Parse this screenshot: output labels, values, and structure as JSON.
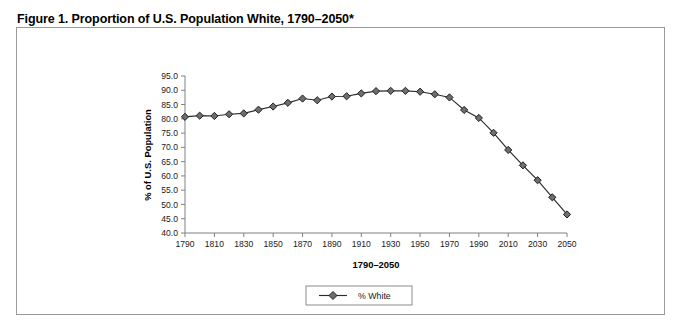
{
  "figure": {
    "title": "Figure 1. Proportion of U.S. Population White, 1790–2050*",
    "border_color": "#9a9a9a",
    "background": "#ffffff"
  },
  "chart_data": {
    "type": "line",
    "title": "",
    "xlabel": "1790–2050",
    "ylabel": "% of U.S. Population",
    "x": [
      1790,
      1800,
      1810,
      1820,
      1830,
      1840,
      1850,
      1860,
      1870,
      1880,
      1890,
      1900,
      1910,
      1920,
      1930,
      1940,
      1950,
      1960,
      1970,
      1980,
      1990,
      2000,
      2010,
      2020,
      2030,
      2040,
      2050
    ],
    "series": [
      {
        "name": "% White",
        "values": [
          80.7,
          81.1,
          81.0,
          81.6,
          81.9,
          83.2,
          84.3,
          85.6,
          87.1,
          86.5,
          87.8,
          87.9,
          88.9,
          89.7,
          89.8,
          89.8,
          89.5,
          88.6,
          87.5,
          83.1,
          80.3,
          75.1,
          69.1,
          63.7,
          58.5,
          52.5,
          46.5
        ]
      }
    ],
    "ylim": [
      40.0,
      95.0
    ],
    "yticks": [
      "40.0",
      "45.0",
      "50.0",
      "55.0",
      "60.0",
      "65.0",
      "70.0",
      "75.0",
      "80.0",
      "85.0",
      "90.0",
      "95.0"
    ],
    "xticks": [
      "1790",
      "1810",
      "1830",
      "1850",
      "1870",
      "1890",
      "1910",
      "1930",
      "1950",
      "1970",
      "1990",
      "2010",
      "2030",
      "2050"
    ],
    "grid": false,
    "legend_position": "bottom-center",
    "marker": "diamond",
    "line_color": "#2b2b2b",
    "marker_fill": "#6e6e6e"
  }
}
